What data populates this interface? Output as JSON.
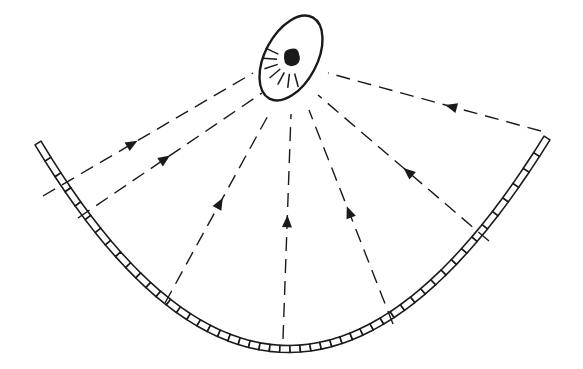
{
  "diagram": {
    "type": "parabolic-reflector-ray-diagram",
    "colors": {
      "background": "#ffffff",
      "stroke": "#1a1a1a"
    },
    "focus": {
      "cx": 291,
      "cy": 58,
      "rx": 26,
      "ry": 46,
      "rotation": 28,
      "source_r": 8
    },
    "reflector": {
      "left_end": [
        38,
        143
      ],
      "bottom": [
        290,
        349
      ],
      "right_end": [
        547,
        138
      ],
      "segment_count": 50
    },
    "rays": [
      {
        "id": "ray-1",
        "from": [
          43,
          196
        ],
        "to": [
          253,
          73
        ],
        "arrow_at": 0.45
      },
      {
        "id": "ray-2",
        "from": [
          78,
          218
        ],
        "to": [
          262,
          93
        ],
        "arrow_at": 0.5
      },
      {
        "id": "ray-3",
        "from": [
          165,
          303
        ],
        "to": [
          270,
          112
        ],
        "arrow_at": 0.55
      },
      {
        "id": "ray-4",
        "from": [
          283,
          339
        ],
        "to": [
          291,
          114
        ],
        "arrow_at": 0.55
      },
      {
        "id": "ray-5",
        "from": [
          393,
          324
        ],
        "to": [
          309,
          110
        ],
        "arrow_at": 0.55
      },
      {
        "id": "ray-6",
        "from": [
          489,
          241
        ],
        "to": [
          318,
          95
        ],
        "arrow_at": 0.5
      },
      {
        "id": "ray-7",
        "from": [
          541,
          131
        ],
        "to": [
          328,
          73
        ],
        "arrow_at": 0.45
      }
    ],
    "short_dashes_near_source": 7
  }
}
